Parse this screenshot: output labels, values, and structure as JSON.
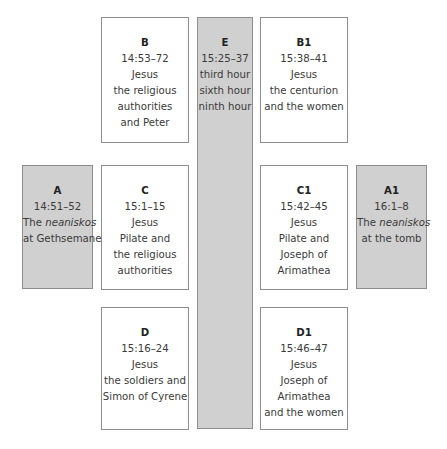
{
  "diagram": {
    "type": "chiastic-structure",
    "boxes": {
      "B": {
        "label": "B",
        "ref": "14:53–72",
        "lines": [
          "Jesus",
          "the religious",
          "authorities",
          "and Peter"
        ],
        "shaded": false
      },
      "C": {
        "label": "C",
        "ref": "15:1–15",
        "lines": [
          "Jesus",
          "Pilate and",
          "the religious",
          "authorities"
        ],
        "shaded": false
      },
      "D": {
        "label": "D",
        "ref": "15:16–24",
        "lines": [
          "Jesus",
          "the soldiers and",
          "Simon of Cyrene"
        ],
        "shaded": false
      },
      "E": {
        "label": "E",
        "ref": "15:25–37",
        "lines": [
          "third hour",
          "sixth hour",
          "ninth hour"
        ],
        "shaded": true
      },
      "B1": {
        "label": "B1",
        "ref": "15:38–41",
        "lines": [
          "Jesus",
          "the centurion",
          "and the women"
        ],
        "shaded": false
      },
      "C1": {
        "label": "C1",
        "ref": "15:42–45",
        "lines": [
          "Jesus",
          "Pilate and",
          "Joseph of",
          "Arimathea"
        ],
        "shaded": false
      },
      "D1": {
        "label": "D1",
        "ref": "15:46–47",
        "lines": [
          "Jesus",
          "Joseph of",
          "Arimathea",
          "and the women"
        ],
        "shaded": false
      },
      "A": {
        "label": "A",
        "ref": "14:51–52",
        "lines_pre": "The ",
        "lines_italic": "neaniskos",
        "lines": [
          "at Gethsemane"
        ],
        "shaded": true
      },
      "A1": {
        "label": "A1",
        "ref": "16:1–8",
        "lines_pre": "The ",
        "lines_italic": "neaniskos",
        "lines": [
          "at the tomb"
        ],
        "shaded": true
      }
    },
    "colors": {
      "shaded_fill": "#d0d0d0",
      "border": "#8e8e8e",
      "text": "#3a3a3a"
    }
  }
}
